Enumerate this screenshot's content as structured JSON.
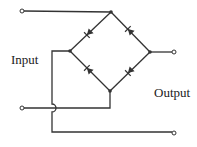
{
  "diagram": {
    "type": "bridge-rectifier",
    "labels": {
      "input": "Input",
      "output": "Output"
    },
    "colors": {
      "wire": "#333333",
      "background": "#ffffff"
    },
    "nodes": {
      "top": [
        111,
        12
      ],
      "left": [
        70,
        51
      ],
      "right": [
        150,
        52
      ],
      "bottom": [
        110,
        91
      ]
    },
    "terminals": {
      "input_top": [
        22,
        11
      ],
      "input_bottom": [
        22,
        108
      ],
      "output_top": [
        174,
        52
      ],
      "output_bottom": [
        174,
        133
      ]
    },
    "diodes": [
      {
        "name": "diode-upper-left",
        "from": "top",
        "to": "left"
      },
      {
        "name": "diode-upper-right",
        "from": "right",
        "to": "top"
      },
      {
        "name": "diode-lower-left",
        "from": "bottom",
        "to": "left"
      },
      {
        "name": "diode-lower-right",
        "from": "right",
        "to": "bottom"
      }
    ]
  }
}
